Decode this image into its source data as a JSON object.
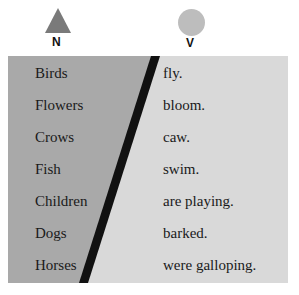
{
  "legend": {
    "noun": {
      "label": "N",
      "shape": "triangle-icon",
      "color": "#7a7a7a"
    },
    "verb": {
      "label": "V",
      "shape": "circle-icon",
      "color": "#bdbdbd"
    }
  },
  "colors": {
    "subject_bg": "#a9a9a9",
    "predicate_bg": "#d9d9d9",
    "divider": "#111111"
  },
  "sentences": [
    {
      "subject": "Birds",
      "predicate": "fly."
    },
    {
      "subject": "Flowers",
      "predicate": "bloom."
    },
    {
      "subject": "Crows",
      "predicate": "caw."
    },
    {
      "subject": "Fish",
      "predicate": "swim."
    },
    {
      "subject": "Children",
      "predicate": "are playing."
    },
    {
      "subject": "Dogs",
      "predicate": "barked."
    },
    {
      "subject": "Horses",
      "predicate": "were galloping."
    }
  ]
}
